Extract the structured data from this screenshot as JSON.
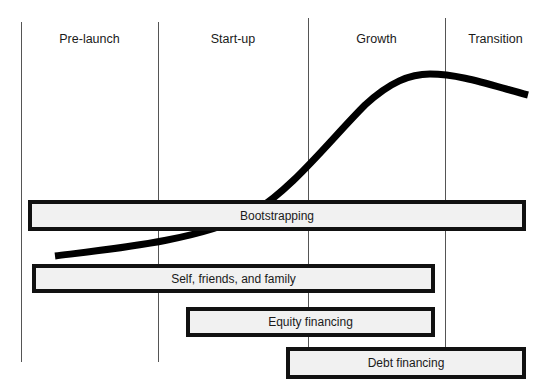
{
  "phases": [
    {
      "label": "Pre-launch"
    },
    {
      "label": "Start-up"
    },
    {
      "label": "Growth"
    },
    {
      "label": "Transition"
    }
  ],
  "financing_sources": [
    {
      "label": "Bootstrapping"
    },
    {
      "label": "Self, friends, and family"
    },
    {
      "label": "Equity financing"
    },
    {
      "label": "Debt financing"
    }
  ],
  "curve": {
    "description": "business growth S-curve",
    "color": "#000000"
  }
}
